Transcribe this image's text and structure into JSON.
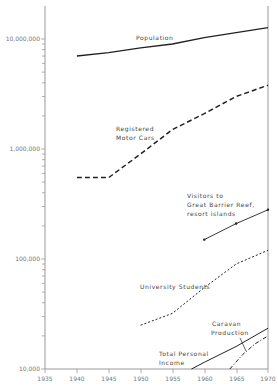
{
  "chart_data": {
    "type": "line",
    "title": "",
    "xlabel": "",
    "ylabel": "",
    "yscale": "log",
    "xlim": [
      1935,
      1970
    ],
    "ylim": [
      10000,
      15000000
    ],
    "x_ticks": [
      "1935",
      "1940",
      "1945",
      "1950",
      "1955",
      "1960",
      "1965",
      "1970"
    ],
    "y_ticks": [
      "10,000",
      "100,000",
      "1,000,000",
      "10,000,000"
    ],
    "grid": false,
    "series": [
      {
        "name": "Population",
        "style": "solid",
        "x": [
          1940,
          1945,
          1950,
          1955,
          1960,
          1965,
          1970
        ],
        "values": [
          7000000,
          7500000,
          8300000,
          9000000,
          10300000,
          11400000,
          12700000
        ]
      },
      {
        "name": "Registered Motor Cars",
        "style": "dashed",
        "x": [
          1940,
          1945,
          1950,
          1955,
          1960,
          1965,
          1970
        ],
        "values": [
          550000,
          550000,
          900000,
          1500000,
          2100000,
          3000000,
          3800000
        ]
      },
      {
        "name": "Visitors to Great Barrier Reef, resort islands",
        "style": "solid-markers",
        "x": [
          1960,
          1965,
          1970
        ],
        "values": [
          150000,
          210000,
          280000
        ]
      },
      {
        "name": "University Students",
        "style": "dotted",
        "x": [
          1950,
          1955,
          1960,
          1965,
          1970
        ],
        "values": [
          25000,
          32000,
          55000,
          90000,
          120000
        ]
      },
      {
        "name": "Caravan Production",
        "style": "dash-dot",
        "x": [
          1964,
          1966,
          1968,
          1970
        ],
        "values": [
          10000,
          13500,
          17000,
          20000
        ]
      },
      {
        "name": "Total Personal Income",
        "style": "solid",
        "x": [
          1958,
          1960,
          1965,
          1970
        ],
        "values": [
          10000,
          11500,
          16000,
          23500
        ]
      }
    ]
  },
  "labels": {
    "population": "Population",
    "cars_1": "Registered",
    "cars_2": "Motor Cars",
    "reef_1": "Visitors to",
    "reef_2": "Great Barrier Reef,",
    "reef_3": "resort islands",
    "univ": "University Students",
    "caravan_1": "Caravan",
    "caravan_2": "Production",
    "income_1": "Total Personal",
    "income_2": "Income"
  },
  "axis": {
    "y": [
      "10,000",
      "100,000",
      "1,000,000",
      "10,000,000"
    ],
    "x": [
      "1935",
      "1940",
      "1945",
      "1950",
      "1955",
      "1960",
      "1965",
      "1970"
    ]
  }
}
